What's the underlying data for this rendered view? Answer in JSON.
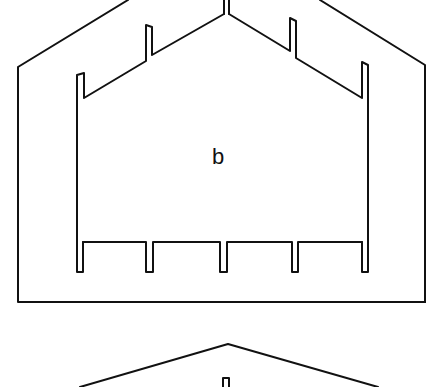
{
  "diagram": {
    "type": "technical-line-drawing",
    "stroke_color": "#111111",
    "background_color": "#ffffff",
    "upper_figure": {
      "label": "b",
      "outer_frame": "pentagon (roof-shaped) outline",
      "inner_profile": {
        "roof_notches": 2,
        "ridge_double_line": true,
        "bottom_teeth": 5
      }
    },
    "lower_figure": {
      "shape": "peaked roof outline",
      "ridge_notch": true
    }
  }
}
